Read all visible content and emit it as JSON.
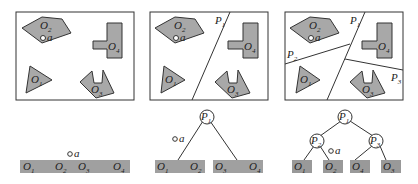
{
  "panels": [
    {
      "name": "no-partition",
      "objects": [
        "O1",
        "O2",
        "O3",
        "O4"
      ],
      "point": "a",
      "partitions": []
    },
    {
      "name": "one-partition",
      "objects": [
        "O1",
        "O2",
        "O3",
        "O4"
      ],
      "point": "a",
      "partitions": [
        "P1"
      ]
    },
    {
      "name": "three-partitions",
      "objects": [
        "O1",
        "O2",
        "O3",
        "O4"
      ],
      "point": "a",
      "partitions": [
        "P1",
        "P2",
        "P3"
      ]
    }
  ],
  "labels": {
    "O": "O",
    "P": "P",
    "a": "a",
    "s1": "1",
    "s2": "2",
    "s3": "3",
    "s4": "4"
  },
  "trees": {
    "flat": {
      "leaves": [
        "O1",
        "O2",
        "O3",
        "O4"
      ],
      "point_between": [
        "O2",
        "O3"
      ]
    },
    "bsp1": {
      "root": "P1",
      "left": [
        "O1",
        "O2"
      ],
      "right": [
        "O3",
        "O4"
      ]
    },
    "bsp2": {
      "root": "P1",
      "left": {
        "node": "P2",
        "leaves": [
          "O1",
          "O2"
        ]
      },
      "right": {
        "node": "P3",
        "leaves": [
          "O4",
          "O3"
        ]
      }
    }
  }
}
